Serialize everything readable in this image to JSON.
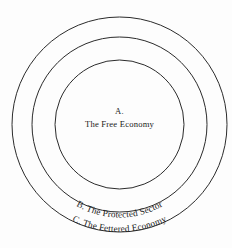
{
  "diagram": {
    "background_color": "#fdfdfd",
    "stroke_color": "#2b2b2b",
    "text_color": "#1a1a1a",
    "center": {
      "cx": 119.5,
      "cy": 124.5
    },
    "rings": [
      {
        "id": "outer",
        "name": "fettered-economy-ring",
        "radius": 107.5
      },
      {
        "id": "middle",
        "name": "protected-sector-ring",
        "radius": 87.5
      },
      {
        "id": "inner",
        "name": "free-economy-ring",
        "radius": 64.5
      }
    ],
    "labels": {
      "inner": {
        "marker": "A.",
        "text": "The Free Economy"
      },
      "middle": {
        "marker": "B.",
        "text": "The Protected Sector",
        "full": "B.  The Protected Sector"
      },
      "outer": {
        "marker": "C.",
        "text": "The Fettered Economy",
        "full": "C.  The Fettered Economy"
      }
    }
  }
}
